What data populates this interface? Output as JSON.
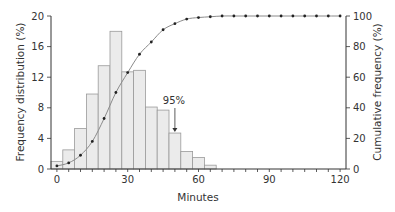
{
  "chart_data": {
    "type": "bar",
    "title": "",
    "xlabel": "Minutes",
    "ylabel": "Frequency distribution (%)",
    "y2label": "Cumulative frequency (%)",
    "xlim": [
      -2.5,
      122.5
    ],
    "ylim": [
      0,
      20
    ],
    "y2lim": [
      0,
      100
    ],
    "x_ticks": [
      0,
      30,
      60,
      90,
      120
    ],
    "x_minor_tick_step": 5,
    "y_ticks": [
      0,
      4,
      8,
      12,
      16,
      20
    ],
    "y2_ticks": [
      0,
      20,
      40,
      60,
      80,
      100
    ],
    "grid": false,
    "bin_width": 5,
    "series": [
      {
        "name": "Frequency distribution (%)",
        "type": "bar",
        "axis": "left",
        "x": [
          0,
          5,
          10,
          15,
          20,
          25,
          30,
          35,
          40,
          45,
          50,
          55,
          60,
          65
        ],
        "values": [
          1.0,
          2.5,
          5.3,
          9.8,
          13.5,
          18.0,
          12.7,
          12.9,
          8.1,
          7.7,
          4.7,
          2.3,
          1.5,
          0.5
        ]
      },
      {
        "name": "Cumulative frequency (%)",
        "type": "line",
        "axis": "right",
        "x": [
          0,
          5,
          10,
          15,
          20,
          25,
          30,
          35,
          40,
          45,
          50,
          55,
          60,
          65,
          70,
          75,
          80,
          85,
          90,
          95,
          100,
          105,
          110,
          115,
          120
        ],
        "values": [
          2,
          4,
          9,
          18,
          33,
          50,
          63,
          75,
          83,
          91,
          95,
          98,
          99,
          99.5,
          100,
          100,
          100,
          100,
          100,
          100,
          100,
          100,
          100,
          100,
          100
        ]
      }
    ],
    "annotations": [
      {
        "text": "95%",
        "x": 50,
        "arrow_to_bar": 50
      }
    ]
  },
  "labels": {
    "xlabel": "Minutes",
    "ylabel": "Frequency distribution (%)",
    "y2label": "Cumulative frequency (%)",
    "annotation": "95%"
  },
  "colors": {
    "bar_fill": "#ebebeb",
    "bar_stroke": "#9a9a9a",
    "axis": "#333333",
    "line": "#8a8a8a",
    "marker": "#222222"
  }
}
